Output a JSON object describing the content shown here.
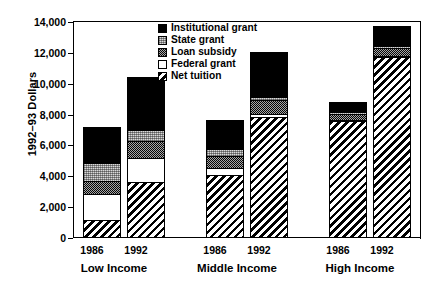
{
  "chart_data": {
    "type": "bar",
    "subtype": "stacked-grouped",
    "title": "",
    "xlabel": "",
    "ylabel": "1992–93 Dollars",
    "ylim": [
      0,
      14000
    ],
    "yticks": [
      "0",
      "2,000",
      "4,000",
      "6,000",
      "8,000",
      "10,000",
      "12,000",
      "14,000"
    ],
    "ytick_values": [
      0,
      2000,
      4000,
      6000,
      8000,
      10000,
      12000,
      14000
    ],
    "grid": false,
    "legend_position": "top-center",
    "groups": [
      "Low Income",
      "Middle Income",
      "High Income"
    ],
    "categories": [
      "1986",
      "1992",
      "1986",
      "1992",
      "1986",
      "1992"
    ],
    "x": [
      {
        "group": "Low Income",
        "year": "1986"
      },
      {
        "group": "Low Income",
        "year": "1992"
      },
      {
        "group": "Middle Income",
        "year": "1986"
      },
      {
        "group": "Middle Income",
        "year": "1992"
      },
      {
        "group": "High Income",
        "year": "1986"
      },
      {
        "group": "High Income",
        "year": "1992"
      }
    ],
    "series": [
      {
        "name": "Net tuition",
        "pattern": "diagonal-hatch",
        "values": [
          1100,
          3550,
          4000,
          7750,
          7500,
          11650
        ]
      },
      {
        "name": "Federal grant",
        "pattern": "white",
        "values": [
          1700,
          1550,
          450,
          200,
          100,
          50
        ]
      },
      {
        "name": "Loan subsidy",
        "pattern": "dark-stipple",
        "values": [
          800,
          1150,
          800,
          900,
          400,
          550
        ]
      },
      {
        "name": "State grant",
        "pattern": "light-stipple",
        "values": [
          1200,
          700,
          450,
          250,
          100,
          100
        ]
      },
      {
        "name": "Institutional grant",
        "pattern": "solid-black",
        "values": [
          2300,
          3400,
          1900,
          2900,
          650,
          1300
        ]
      }
    ],
    "totals": [
      7100,
      10350,
      7600,
      12000,
      8750,
      13650
    ],
    "stack_order_bottom_to_top": [
      "Net tuition",
      "Federal grant",
      "Loan subsidy",
      "State grant",
      "Institutional grant"
    ]
  },
  "legend": {
    "items": [
      {
        "label": "Institutional grant",
        "swatch": "solid-black"
      },
      {
        "label": "State grant",
        "swatch": "light-stipple"
      },
      {
        "label": "Loan subsidy",
        "swatch": "dark-stipple"
      },
      {
        "label": "Federal grant",
        "swatch": "white"
      },
      {
        "label": "Net tuition",
        "swatch": "diagonal-hatch"
      }
    ]
  },
  "axis": {
    "y_title": "1992–93 Dollars",
    "tick_0": "0",
    "tick_1": "2,000",
    "tick_2": "4,000",
    "tick_3": "6,000",
    "tick_4": "8,000",
    "tick_5": "10,000",
    "tick_6": "12,000",
    "tick_7": "14,000"
  },
  "xaxis": {
    "year_lo_1986": "1986",
    "year_lo_1992": "1992",
    "year_mid_1986": "1986",
    "year_mid_1992": "1992",
    "year_hi_1986": "1986",
    "year_hi_1992": "1992",
    "group_low": "Low Income",
    "group_middle": "Middle Income",
    "group_high": "High Income"
  },
  "colors": {
    "ink": "#000000",
    "paper": "#ffffff",
    "stipple_dark": "#3a3a3a",
    "stipple_light": "#d9d9d9"
  }
}
